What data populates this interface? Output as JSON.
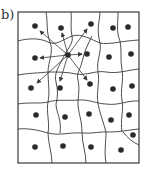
{
  "panel": {
    "label": "b)"
  },
  "colors": {
    "stroke": "#3a3a3a",
    "dot": "#2a2a2a",
    "background": "#ffffff"
  },
  "frame": {
    "x": 18,
    "y": 12,
    "width": 121,
    "height": 151
  },
  "dots": [
    [
      35,
      26
    ],
    [
      61,
      28
    ],
    [
      91,
      24
    ],
    [
      113,
      28
    ],
    [
      128,
      27
    ],
    [
      35,
      58
    ],
    [
      68,
      55
    ],
    [
      87,
      54
    ],
    [
      109,
      57
    ],
    [
      131,
      54
    ],
    [
      31,
      88
    ],
    [
      60,
      88
    ],
    [
      90,
      84
    ],
    [
      113,
      89
    ],
    [
      132,
      86
    ],
    [
      36,
      115
    ],
    [
      65,
      117
    ],
    [
      89,
      114
    ],
    [
      111,
      120
    ],
    [
      129,
      115
    ],
    [
      35,
      147
    ],
    [
      63,
      146
    ],
    [
      91,
      147
    ],
    [
      121,
      150
    ],
    [
      133,
      135
    ]
  ],
  "center": [
    68,
    55
  ],
  "arrow_tips": [
    [
      40,
      31
    ],
    [
      62,
      33
    ],
    [
      87,
      29
    ],
    [
      40,
      58
    ],
    [
      82,
      54
    ],
    [
      37,
      83
    ],
    [
      60,
      81
    ],
    [
      87,
      80
    ]
  ]
}
